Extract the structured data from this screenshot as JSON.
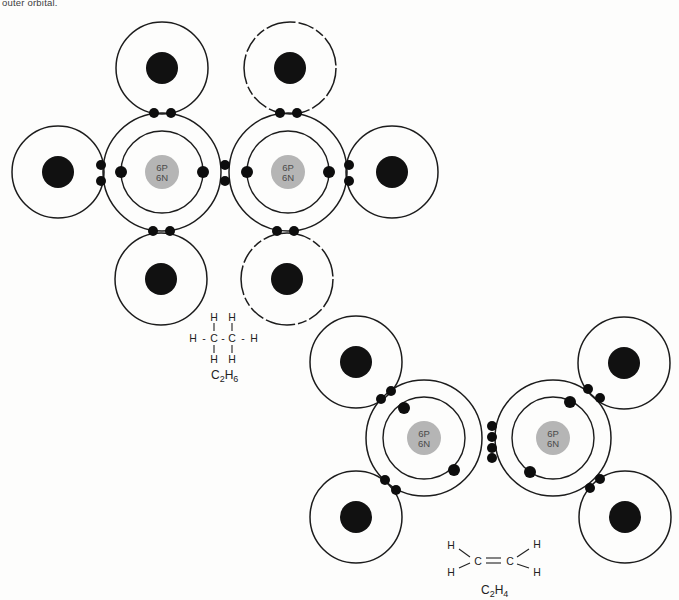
{
  "caption": "outer orbital.",
  "colors": {
    "background": "#fdfdfc",
    "orbit_stroke": "#1c1c1c",
    "nucleus_gray": "#b5b5b5",
    "nucleus_text": "#4a4a4a",
    "hydrogen_nucleus": "#111111",
    "electron": "#0d0d0d",
    "formula_text": "#222222"
  },
  "molecules": [
    {
      "id": "ethane",
      "formula": "C2H6",
      "carbons": [
        {
          "id": "carbon-left",
          "x": 162,
          "y": 172,
          "outer_r": 59,
          "inner_r": 41,
          "nucleus_r": 17,
          "proton_label": "6P",
          "neutron_label": "6N"
        },
        {
          "id": "carbon-right",
          "x": 288,
          "y": 172,
          "outer_r": 59,
          "inner_r": 41,
          "nucleus_r": 17,
          "proton_label": "6P",
          "neutron_label": "6N"
        }
      ],
      "hydrogens": [
        {
          "id": "hydrogen-top-left",
          "x": 162,
          "y": 68,
          "r": 46,
          "nucleus_r": 16,
          "dashed": false
        },
        {
          "id": "hydrogen-top-right",
          "x": 290,
          "y": 68,
          "r": 46,
          "nucleus_r": 16,
          "dashed": true
        },
        {
          "id": "hydrogen-left",
          "x": 58,
          "y": 172,
          "r": 46,
          "nucleus_r": 16,
          "dashed": false
        },
        {
          "id": "hydrogen-right",
          "x": 392,
          "y": 172,
          "r": 46,
          "nucleus_r": 16,
          "dashed": false
        },
        {
          "id": "hydrogen-bottom-left",
          "x": 161,
          "y": 279,
          "r": 46,
          "nucleus_r": 16,
          "dashed": false
        },
        {
          "id": "hydrogen-bottom-right",
          "x": 287,
          "y": 279,
          "r": 46,
          "nucleus_r": 16,
          "dashed": true
        }
      ],
      "inner_electrons": [
        [
          121,
          172
        ],
        [
          203,
          172
        ],
        [
          247,
          172
        ],
        [
          329,
          172
        ]
      ],
      "bond_electrons": [
        [
          154,
          113
        ],
        [
          171,
          113
        ],
        [
          280,
          113
        ],
        [
          297,
          113
        ],
        [
          101,
          165
        ],
        [
          101,
          181
        ],
        [
          349,
          165
        ],
        [
          349,
          181
        ],
        [
          153,
          231
        ],
        [
          170,
          231
        ],
        [
          277,
          231
        ],
        [
          294,
          231
        ],
        [
          225,
          165
        ],
        [
          225,
          181
        ]
      ]
    },
    {
      "id": "ethylene",
      "formula": "C2H4",
      "carbons": [
        {
          "id": "carbon-left",
          "x": 424,
          "y": 438,
          "outer_r": 58,
          "inner_r": 41,
          "nucleus_r": 17,
          "proton_label": "6P",
          "neutron_label": "6N"
        },
        {
          "id": "carbon-right",
          "x": 553,
          "y": 438,
          "outer_r": 58,
          "inner_r": 41,
          "nucleus_r": 17,
          "proton_label": "6P",
          "neutron_label": "6N"
        }
      ],
      "hydrogens": [
        {
          "id": "hydrogen-top-left",
          "x": 356,
          "y": 362,
          "r": 46,
          "nucleus_r": 16,
          "dashed": false
        },
        {
          "id": "hydrogen-bottom-left",
          "x": 356,
          "y": 517,
          "r": 46,
          "nucleus_r": 16,
          "dashed": false
        },
        {
          "id": "hydrogen-top-right",
          "x": 624,
          "y": 363,
          "r": 46,
          "nucleus_r": 16,
          "dashed": false
        },
        {
          "id": "hydrogen-bottom-right",
          "x": 625,
          "y": 517,
          "r": 46,
          "nucleus_r": 16,
          "dashed": false
        }
      ],
      "inner_electrons": [
        [
          404,
          408
        ],
        [
          454,
          470
        ],
        [
          570,
          402
        ],
        [
          530,
          472
        ]
      ],
      "bond_electrons": [
        [
          381,
          399
        ],
        [
          391,
          391
        ],
        [
          385,
          480
        ],
        [
          396,
          490
        ],
        [
          588,
          389
        ],
        [
          600,
          398
        ],
        [
          590,
          488
        ],
        [
          600,
          479
        ],
        [
          492,
          426
        ],
        [
          492,
          437
        ],
        [
          492,
          448
        ],
        [
          492,
          458
        ]
      ]
    }
  ],
  "structural_formulas": [
    {
      "id": "ethane-structural-formula",
      "atoms": [
        {
          "t": "H",
          "x": 214,
          "y": 317
        },
        {
          "t": "H",
          "x": 232,
          "y": 317
        },
        {
          "t": "H",
          "x": 193,
          "y": 338
        },
        {
          "t": "-",
          "x": 204,
          "y": 338
        },
        {
          "t": "C",
          "x": 214,
          "y": 338
        },
        {
          "t": "-",
          "x": 223,
          "y": 338
        },
        {
          "t": "C",
          "x": 232,
          "y": 338
        },
        {
          "t": "-",
          "x": 243,
          "y": 338
        },
        {
          "t": "H",
          "x": 254,
          "y": 338
        },
        {
          "t": "H",
          "x": 214,
          "y": 359
        },
        {
          "t": "H",
          "x": 232,
          "y": 359
        }
      ],
      "bonds": [
        {
          "x1": 214,
          "y1": 323,
          "x2": 214,
          "y2": 331
        },
        {
          "x1": 232,
          "y1": 323,
          "x2": 232,
          "y2": 331
        },
        {
          "x1": 214,
          "y1": 345,
          "x2": 214,
          "y2": 353
        },
        {
          "x1": 232,
          "y1": 345,
          "x2": 232,
          "y2": 353
        }
      ],
      "label_parts": [
        {
          "t": "C"
        },
        {
          "t": "2",
          "sub": true
        },
        {
          "t": "H"
        },
        {
          "t": "6",
          "sub": true
        }
      ],
      "label_x": 211,
      "label_y": 379
    },
    {
      "id": "ethylene-structural-formula",
      "atoms": [
        {
          "t": "H",
          "x": 451,
          "y": 545
        },
        {
          "t": "H",
          "x": 451,
          "y": 572
        },
        {
          "t": "C",
          "x": 478,
          "y": 561
        },
        {
          "t": "C",
          "x": 510,
          "y": 561
        },
        {
          "t": "H",
          "x": 537,
          "y": 544
        },
        {
          "t": "H",
          "x": 537,
          "y": 572
        }
      ],
      "bonds": [
        {
          "x1": 459,
          "y1": 549,
          "x2": 470,
          "y2": 557
        },
        {
          "x1": 459,
          "y1": 568,
          "x2": 470,
          "y2": 563
        },
        {
          "x1": 517,
          "y1": 557,
          "x2": 529,
          "y2": 549
        },
        {
          "x1": 517,
          "y1": 564,
          "x2": 529,
          "y2": 568
        },
        {
          "x1": 486,
          "y1": 558,
          "x2": 501,
          "y2": 558
        },
        {
          "x1": 486,
          "y1": 563,
          "x2": 501,
          "y2": 563
        }
      ],
      "label_parts": [
        {
          "t": "C"
        },
        {
          "t": "2",
          "sub": true
        },
        {
          "t": "H"
        },
        {
          "t": "4",
          "sub": true
        }
      ],
      "label_x": 481,
      "label_y": 594
    }
  ]
}
